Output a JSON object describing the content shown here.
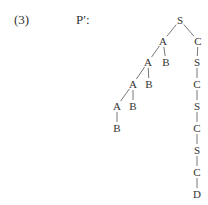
{
  "label_number": "(3)",
  "label_tree": "P′:",
  "tree": {
    "nodes": [
      {
        "id": "n0",
        "label": "S"
      },
      {
        "id": "n1",
        "label": "A"
      },
      {
        "id": "n2",
        "label": "C"
      },
      {
        "id": "n3",
        "label": "A"
      },
      {
        "id": "n4",
        "label": "B"
      },
      {
        "id": "n5",
        "label": "S"
      },
      {
        "id": "n6",
        "label": "A"
      },
      {
        "id": "n7",
        "label": "B"
      },
      {
        "id": "n8",
        "label": "C"
      },
      {
        "id": "n9",
        "label": "A"
      },
      {
        "id": "n10",
        "label": "B"
      },
      {
        "id": "n11",
        "label": "S"
      },
      {
        "id": "n12",
        "label": "B"
      },
      {
        "id": "n13",
        "label": "C"
      },
      {
        "id": "n14",
        "label": "S"
      },
      {
        "id": "n15",
        "label": "C"
      },
      {
        "id": "n16",
        "label": "D"
      }
    ],
    "edges": [
      [
        "n0",
        "n1"
      ],
      [
        "n0",
        "n2"
      ],
      [
        "n1",
        "n3"
      ],
      [
        "n1",
        "n4"
      ],
      [
        "n2",
        "n5"
      ],
      [
        "n3",
        "n6"
      ],
      [
        "n3",
        "n7"
      ],
      [
        "n5",
        "n8"
      ],
      [
        "n6",
        "n9"
      ],
      [
        "n6",
        "n10"
      ],
      [
        "n8",
        "n11"
      ],
      [
        "n9",
        "n12"
      ],
      [
        "n11",
        "n13"
      ],
      [
        "n13",
        "n14"
      ],
      [
        "n14",
        "n15"
      ],
      [
        "n15",
        "n16"
      ]
    ]
  }
}
